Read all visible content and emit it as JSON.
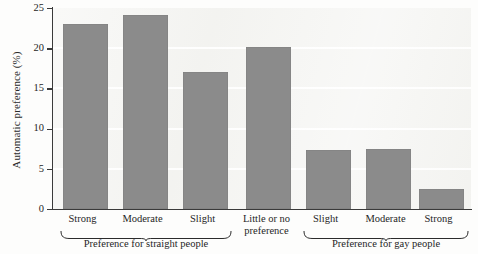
{
  "chart_data": {
    "type": "bar",
    "title": "",
    "xlabel": "",
    "ylabel": "Automatic preference (%)",
    "ylim": [
      0,
      25
    ],
    "yticks": [
      0,
      5,
      10,
      15,
      20,
      25
    ],
    "ytick_labels": [
      "0",
      "5",
      "10",
      "15",
      "20",
      "25"
    ],
    "grid": "horizontal-white",
    "legend": "none",
    "bar_color": "#8b8b8b",
    "plot_background": "#f2f2ef",
    "categories": [
      "Strong",
      "Moderate",
      "Slight",
      "Little or no preference",
      "Slight",
      "Moderate",
      "Strong"
    ],
    "values": [
      23.0,
      24.1,
      17.1,
      20.2,
      7.4,
      7.5,
      2.5
    ],
    "bars": [
      {
        "label": "Strong",
        "label_line1": "Strong",
        "label_line2": "",
        "value": 23.0,
        "group": "Preference for straight people"
      },
      {
        "label": "Moderate",
        "label_line1": "Moderate",
        "label_line2": "",
        "value": 24.1,
        "group": "Preference for straight people"
      },
      {
        "label": "Slight",
        "label_line1": "Slight",
        "label_line2": "",
        "value": 17.1,
        "group": "Preference for straight people"
      },
      {
        "label": "Little or no preference",
        "label_line1": "Little or no",
        "label_line2": "preference",
        "value": 20.2,
        "group": ""
      },
      {
        "label": "Slight",
        "label_line1": "Slight",
        "label_line2": "",
        "value": 7.4,
        "group": "Preference for gay people"
      },
      {
        "label": "Moderate",
        "label_line1": "Moderate",
        "label_line2": "",
        "value": 7.5,
        "group": "Preference for gay people"
      },
      {
        "label": "Strong",
        "label_line1": "Strong",
        "label_line2": "",
        "value": 2.5,
        "group": "Preference for gay people"
      }
    ],
    "groups": [
      {
        "label": "Preference for straight people",
        "bars": [
          0,
          1,
          2
        ]
      },
      {
        "label": "Preference for gay people",
        "bars": [
          4,
          5,
          6
        ]
      }
    ]
  }
}
